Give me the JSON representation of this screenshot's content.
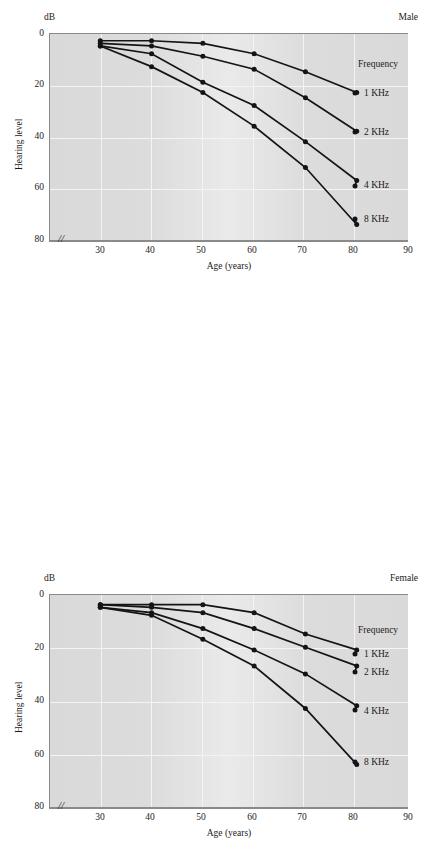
{
  "figure": {
    "panels": [
      {
        "id": "male",
        "title": "Male",
        "ylabel": "Hearing level",
        "yunit": "dB",
        "xlabel": "Age (years)",
        "legend_title": "Frequency",
        "yticks": [
          "0",
          "20",
          "40",
          "60",
          "80"
        ],
        "xticks": [
          "30",
          "40",
          "50",
          "60",
          "70",
          "80",
          "90"
        ],
        "axis_break": "//"
      },
      {
        "id": "female",
        "title": "Female",
        "ylabel": "Hearing level",
        "yunit": "dB",
        "xlabel": "Age (years)",
        "legend_title": "Frequency",
        "yticks": [
          "0",
          "20",
          "40",
          "60",
          "80"
        ],
        "xticks": [
          "30",
          "40",
          "50",
          "60",
          "70",
          "80",
          "90"
        ],
        "axis_break": "//"
      }
    ],
    "series_labels": [
      "1 KHz",
      "2 KHz",
      "4 KHz",
      "8 KHz"
    ]
  },
  "chart_data": [
    {
      "type": "line",
      "title": "Male",
      "xlabel": "Age (years)",
      "ylabel": "Hearing level",
      "yunit": "dB",
      "xlim": [
        20,
        90
      ],
      "ylim": [
        0,
        80
      ],
      "y_inverted": true,
      "grid": true,
      "legend_title": "Frequency",
      "legend_position": "right",
      "x": [
        30,
        40,
        50,
        60,
        70,
        80
      ],
      "series": [
        {
          "name": "1 KHz",
          "values": [
            3,
            3,
            4,
            8,
            15,
            23
          ]
        },
        {
          "name": "2 KHz",
          "values": [
            4,
            5,
            9,
            14,
            25,
            38
          ]
        },
        {
          "name": "4 KHz",
          "values": [
            5,
            8,
            19,
            28,
            42,
            57
          ]
        },
        {
          "name": "8 KHz",
          "values": [
            5,
            13,
            23,
            36,
            52,
            74
          ]
        }
      ]
    },
    {
      "type": "line",
      "title": "Female",
      "xlabel": "Age (years)",
      "ylabel": "Hearing level",
      "yunit": "dB",
      "xlim": [
        20,
        90
      ],
      "ylim": [
        0,
        80
      ],
      "y_inverted": true,
      "grid": true,
      "legend_title": "Frequency",
      "legend_position": "right",
      "x": [
        30,
        40,
        50,
        60,
        70,
        80
      ],
      "series": [
        {
          "name": "1 KHz",
          "values": [
            4,
            4,
            4,
            7,
            15,
            21
          ]
        },
        {
          "name": "2 KHz",
          "values": [
            4,
            5,
            7,
            13,
            20,
            27
          ]
        },
        {
          "name": "4 KHz",
          "values": [
            5,
            7,
            13,
            21,
            30,
            42
          ]
        },
        {
          "name": "8 KHz",
          "values": [
            5,
            8,
            17,
            27,
            43,
            64
          ]
        }
      ]
    }
  ]
}
